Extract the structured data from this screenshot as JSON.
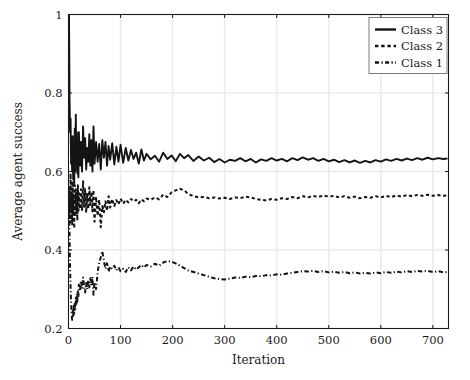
{
  "chart_data": {
    "type": "line",
    "title": "",
    "xlabel": "Iteration",
    "ylabel": "Average agent success",
    "xlim": [
      0,
      730
    ],
    "ylim": [
      0.2,
      1.0
    ],
    "xticks": [
      0,
      100,
      200,
      300,
      400,
      500,
      600,
      700
    ],
    "xtick_labels": [
      "0",
      "100",
      "200",
      "300",
      "400",
      "500",
      "600",
      "700"
    ],
    "yticks": [
      0.2,
      0.4,
      0.6,
      0.8,
      1.0
    ],
    "ytick_labels": [
      "0.2",
      "0.4",
      "0.6",
      "0.8",
      "1"
    ],
    "grid": true,
    "legend_position": "top-right",
    "legend_entries": [
      {
        "label": "Class 3",
        "dash": "solid"
      },
      {
        "label": "Class 2",
        "dash": "dashed"
      },
      {
        "label": "Class 1",
        "dash": "dashdot"
      }
    ],
    "series": [
      {
        "name": "Class 3",
        "dash": "solid",
        "color": "#141414",
        "x": [
          1,
          2,
          3,
          4,
          5,
          6,
          7,
          8,
          9,
          10,
          11,
          12,
          13,
          14,
          15,
          16,
          17,
          18,
          19,
          20,
          22,
          24,
          26,
          28,
          30,
          32,
          34,
          36,
          38,
          40,
          42,
          44,
          46,
          48,
          50,
          53,
          56,
          59,
          62,
          65,
          68,
          71,
          74,
          77,
          80,
          84,
          88,
          92,
          96,
          100,
          105,
          110,
          115,
          120,
          125,
          130,
          135,
          140,
          145,
          150,
          158,
          166,
          174,
          182,
          190,
          198,
          206,
          214,
          222,
          230,
          240,
          250,
          260,
          270,
          280,
          290,
          300,
          310,
          320,
          330,
          340,
          350,
          360,
          370,
          380,
          390,
          400,
          410,
          420,
          430,
          440,
          450,
          460,
          470,
          480,
          490,
          500,
          510,
          520,
          530,
          540,
          550,
          560,
          570,
          580,
          590,
          600,
          610,
          620,
          630,
          640,
          650,
          660,
          670,
          680,
          690,
          700,
          710,
          720,
          728
        ],
        "y": [
          1.0,
          0.79,
          0.7,
          0.735,
          0.62,
          0.66,
          0.6,
          0.69,
          0.58,
          0.655,
          0.565,
          0.71,
          0.6,
          0.745,
          0.635,
          0.7,
          0.595,
          0.665,
          0.585,
          0.7,
          0.615,
          0.675,
          0.6,
          0.715,
          0.635,
          0.685,
          0.605,
          0.66,
          0.625,
          0.695,
          0.615,
          0.68,
          0.6,
          0.715,
          0.62,
          0.675,
          0.625,
          0.67,
          0.605,
          0.68,
          0.635,
          0.675,
          0.615,
          0.665,
          0.63,
          0.672,
          0.618,
          0.663,
          0.625,
          0.668,
          0.622,
          0.66,
          0.628,
          0.655,
          0.632,
          0.648,
          0.62,
          0.656,
          0.628,
          0.645,
          0.631,
          0.64,
          0.625,
          0.648,
          0.632,
          0.641,
          0.626,
          0.645,
          0.634,
          0.642,
          0.627,
          0.638,
          0.628,
          0.635,
          0.624,
          0.632,
          0.623,
          0.63,
          0.627,
          0.634,
          0.626,
          0.632,
          0.623,
          0.631,
          0.627,
          0.634,
          0.628,
          0.632,
          0.626,
          0.634,
          0.629,
          0.636,
          0.63,
          0.634,
          0.627,
          0.632,
          0.626,
          0.63,
          0.624,
          0.629,
          0.623,
          0.628,
          0.622,
          0.627,
          0.623,
          0.629,
          0.625,
          0.631,
          0.627,
          0.632,
          0.628,
          0.633,
          0.629,
          0.634,
          0.63,
          0.635,
          0.631,
          0.634,
          0.632,
          0.633
        ]
      },
      {
        "name": "Class 2",
        "dash": "dashed",
        "color": "#141414",
        "x": [
          1,
          2,
          3,
          4,
          5,
          6,
          7,
          8,
          9,
          10,
          11,
          12,
          13,
          14,
          15,
          16,
          17,
          18,
          19,
          20,
          22,
          24,
          26,
          28,
          30,
          32,
          34,
          36,
          38,
          40,
          42,
          44,
          46,
          48,
          50,
          53,
          56,
          59,
          62,
          65,
          68,
          71,
          74,
          77,
          80,
          84,
          88,
          92,
          96,
          100,
          105,
          110,
          115,
          120,
          125,
          130,
          135,
          140,
          145,
          150,
          158,
          166,
          174,
          182,
          190,
          198,
          206,
          214,
          222,
          230,
          240,
          250,
          260,
          270,
          280,
          290,
          300,
          310,
          320,
          330,
          340,
          350,
          360,
          370,
          380,
          390,
          400,
          410,
          420,
          430,
          440,
          450,
          460,
          470,
          480,
          490,
          500,
          510,
          520,
          530,
          540,
          550,
          560,
          570,
          580,
          590,
          600,
          610,
          620,
          630,
          640,
          650,
          660,
          670,
          680,
          690,
          700,
          710,
          720,
          728
        ],
        "y": [
          0.5,
          0.56,
          0.47,
          0.595,
          0.5,
          0.545,
          0.465,
          0.575,
          0.49,
          0.54,
          0.455,
          0.565,
          0.485,
          0.555,
          0.5,
          0.545,
          0.475,
          0.565,
          0.495,
          0.545,
          0.505,
          0.555,
          0.5,
          0.575,
          0.51,
          0.555,
          0.495,
          0.545,
          0.505,
          0.56,
          0.515,
          0.548,
          0.498,
          0.553,
          0.472,
          0.535,
          0.487,
          0.528,
          0.458,
          0.512,
          0.496,
          0.524,
          0.5,
          0.537,
          0.508,
          0.53,
          0.512,
          0.527,
          0.516,
          0.531,
          0.518,
          0.528,
          0.521,
          0.53,
          0.524,
          0.528,
          0.519,
          0.529,
          0.524,
          0.531,
          0.528,
          0.534,
          0.529,
          0.541,
          0.535,
          0.547,
          0.552,
          0.556,
          0.552,
          0.543,
          0.537,
          0.534,
          0.535,
          0.532,
          0.534,
          0.531,
          0.533,
          0.53,
          0.534,
          0.532,
          0.536,
          0.534,
          0.53,
          0.528,
          0.526,
          0.53,
          0.528,
          0.532,
          0.53,
          0.535,
          0.532,
          0.537,
          0.534,
          0.538,
          0.535,
          0.539,
          0.536,
          0.538,
          0.534,
          0.537,
          0.533,
          0.536,
          0.532,
          0.535,
          0.533,
          0.537,
          0.534,
          0.538,
          0.535,
          0.539,
          0.536,
          0.54,
          0.537,
          0.54,
          0.538,
          0.541,
          0.538,
          0.54,
          0.538,
          0.539
        ]
      },
      {
        "name": "Class 1",
        "dash": "dashdot",
        "color": "#141414",
        "x": [
          1,
          2,
          3,
          4,
          5,
          6,
          7,
          8,
          9,
          10,
          11,
          12,
          13,
          14,
          15,
          16,
          17,
          18,
          19,
          20,
          22,
          24,
          26,
          28,
          30,
          32,
          34,
          36,
          38,
          40,
          42,
          44,
          46,
          48,
          50,
          53,
          56,
          59,
          62,
          65,
          68,
          71,
          74,
          77,
          80,
          84,
          88,
          92,
          96,
          100,
          105,
          110,
          115,
          120,
          125,
          130,
          135,
          140,
          145,
          150,
          158,
          166,
          174,
          182,
          190,
          198,
          206,
          214,
          222,
          230,
          240,
          250,
          260,
          270,
          280,
          290,
          300,
          310,
          320,
          330,
          340,
          350,
          360,
          370,
          380,
          390,
          400,
          410,
          420,
          430,
          440,
          450,
          460,
          470,
          480,
          490,
          500,
          510,
          520,
          530,
          540,
          550,
          560,
          570,
          580,
          590,
          600,
          610,
          620,
          630,
          640,
          650,
          660,
          670,
          680,
          690,
          700,
          710,
          720,
          728
        ],
        "y": [
          0.5,
          0.44,
          0.355,
          0.305,
          0.265,
          0.235,
          0.222,
          0.245,
          0.228,
          0.258,
          0.238,
          0.268,
          0.248,
          0.278,
          0.258,
          0.288,
          0.268,
          0.298,
          0.282,
          0.312,
          0.295,
          0.322,
          0.302,
          0.33,
          0.308,
          0.292,
          0.316,
          0.3,
          0.324,
          0.305,
          0.328,
          0.31,
          0.332,
          0.286,
          0.318,
          0.3,
          0.344,
          0.369,
          0.381,
          0.397,
          0.372,
          0.352,
          0.366,
          0.345,
          0.358,
          0.352,
          0.36,
          0.348,
          0.356,
          0.346,
          0.352,
          0.344,
          0.356,
          0.348,
          0.358,
          0.35,
          0.356,
          0.362,
          0.355,
          0.362,
          0.358,
          0.365,
          0.36,
          0.368,
          0.372,
          0.37,
          0.366,
          0.36,
          0.354,
          0.348,
          0.344,
          0.34,
          0.336,
          0.332,
          0.328,
          0.326,
          0.325,
          0.327,
          0.33,
          0.329,
          0.332,
          0.331,
          0.334,
          0.333,
          0.336,
          0.335,
          0.338,
          0.337,
          0.34,
          0.342,
          0.344,
          0.346,
          0.345,
          0.347,
          0.344,
          0.346,
          0.343,
          0.345,
          0.342,
          0.344,
          0.341,
          0.343,
          0.34,
          0.342,
          0.34,
          0.343,
          0.341,
          0.344,
          0.342,
          0.345,
          0.343,
          0.346,
          0.344,
          0.347,
          0.345,
          0.347,
          0.344,
          0.346,
          0.343,
          0.344
        ]
      }
    ]
  },
  "style": {
    "axis_color": "#1a1a1a",
    "grid_color": "#ebebeb",
    "line_color": "#141414",
    "background": "#ffffff"
  }
}
